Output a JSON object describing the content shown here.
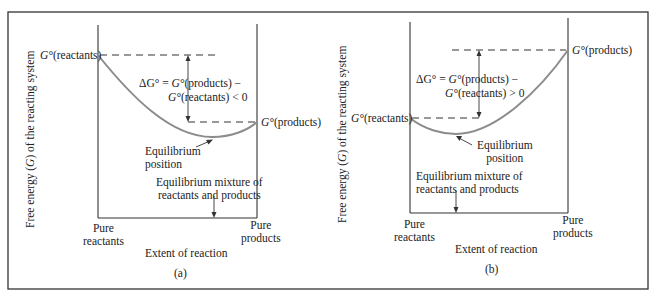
{
  "figure": {
    "panels": [
      {
        "id": "a",
        "caption": "(a)",
        "y_axis_label_pre": "Free energy (",
        "y_axis_label_var": "G",
        "y_axis_label_post": ") of the reacting system",
        "x_axis_label": "Extent of reaction",
        "x_left_label_1": "Pure",
        "x_left_label_2": "reactants",
        "x_right_label_1": "Pure",
        "x_right_label_2": "products",
        "g_reactants_label": "(reactants)",
        "g_products_label": "(products)",
        "g_symbol": "G°",
        "delta_line1_prefix": "ΔG° = ",
        "delta_line1_suffix": "(products) −",
        "delta_line2_suffix": "(reactants) < 0",
        "equilibrium_position_1": "Equilibrium",
        "equilibrium_position_2": "position",
        "mixture_1": "Equilibrium mixture of",
        "mixture_2": "reactants and products",
        "delta_sign": "< 0"
      },
      {
        "id": "b",
        "caption": "(b)",
        "y_axis_label_pre": "Free energy (",
        "y_axis_label_var": "G",
        "y_axis_label_post": ") of the reacting system",
        "x_axis_label": "Extent of reaction",
        "x_left_label_1": "Pure",
        "x_left_label_2": "reactants",
        "x_right_label_1": "Pure",
        "x_right_label_2": "products",
        "g_reactants_label": "(reactants)",
        "g_products_label": "(products)",
        "g_symbol": "G°",
        "delta_line1_prefix": "ΔG° = ",
        "delta_line1_suffix": "(products) −",
        "delta_line2_suffix": "(reactants) > 0",
        "equilibrium_position_1": "Equilibrium",
        "equilibrium_position_2": "position",
        "mixture_1": "Equilibrium mixture of",
        "mixture_2": "reactants and products",
        "delta_sign": "> 0"
      }
    ],
    "colors": {
      "curve": "#8c8c8c",
      "lines": "#333333",
      "frame": "#333333"
    }
  }
}
